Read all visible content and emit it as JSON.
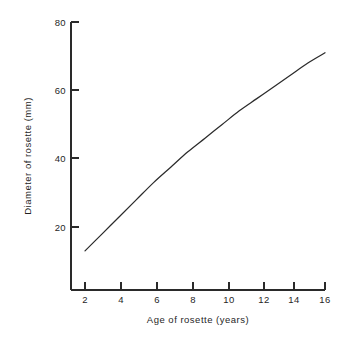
{
  "chart_data": {
    "type": "line",
    "title": "",
    "xlabel": "Age of rosette (years)",
    "ylabel": "Diameter of rosette (mm)",
    "xlim": [
      0,
      17
    ],
    "ylim": [
      0,
      85
    ],
    "xticks": [
      2,
      4,
      6,
      8,
      10,
      12,
      14,
      16
    ],
    "xticklabels": [
      "2",
      "4",
      "6",
      "8",
      "10",
      "12",
      "14",
      "16"
    ],
    "yticks": [
      20,
      40,
      60,
      80
    ],
    "yticklabels": [
      "20",
      "40",
      "60",
      "80"
    ],
    "grid": false,
    "legend": false,
    "series": [
      {
        "name": "rosette growth",
        "x": [
          2,
          3,
          4,
          5,
          6,
          7,
          8,
          9,
          10,
          11,
          12,
          13,
          14,
          15,
          16
        ],
        "values": [
          13,
          18,
          23,
          28,
          33,
          37.5,
          42,
          46,
          50,
          54,
          57.5,
          61,
          64.5,
          68,
          71
        ]
      }
    ]
  },
  "axes": {
    "x_title": "Age of rosette (years)",
    "y_title": "Diameter of rosette (mm)",
    "x_tick_labels": [
      "2",
      "4",
      "6",
      "8",
      "10",
      "12",
      "14",
      "16"
    ],
    "y_tick_labels": [
      "20",
      "40",
      "60",
      "80"
    ]
  },
  "style": {
    "background": "#ffffff",
    "line_color": "#2b2b2b",
    "axis_color": "#2a2a2a",
    "text_color": "#1f1f1f"
  }
}
